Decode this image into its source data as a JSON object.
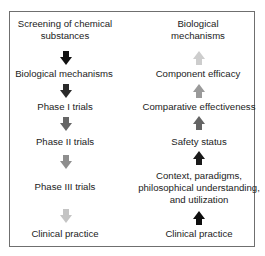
{
  "left_column": {
    "direction": "down",
    "steps": [
      {
        "label": "Screening of chemical\nsubstances"
      },
      {
        "label": "Biological mechanisms"
      },
      {
        "label": "Phase I trials"
      },
      {
        "label": "Phase II trials"
      },
      {
        "label": "Phase III trials"
      },
      {
        "label": "Clinical practice"
      }
    ],
    "arrow_colors": [
      "#111111",
      "#2a2a2a",
      "#666666",
      "#8e8e8e",
      "#c4c4c4"
    ]
  },
  "right_column": {
    "direction": "up",
    "steps": [
      {
        "label": "Biological\nmechanisms"
      },
      {
        "label": "Component efficacy"
      },
      {
        "label": "Comparative effectiveness"
      },
      {
        "label": "Safety status"
      },
      {
        "label": "Context, paradigms,\nphilosophical understanding,\nand utilization"
      },
      {
        "label": "Clinical practice"
      }
    ],
    "arrow_colors": [
      "#cdcdcd",
      "#9a9a9a",
      "#646464",
      "#1a1a1a",
      "#0e0e0e"
    ]
  }
}
